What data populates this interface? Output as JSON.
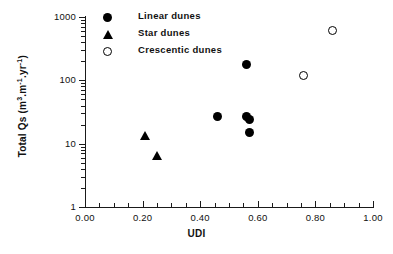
{
  "chart_data": {
    "type": "scatter",
    "title": "",
    "xlabel": "UDI",
    "ylabel": "Total Qs (m3.m-1.yr-1)",
    "ylabel_parts": {
      "prefix": "Total Qs (m",
      "exp1": "3",
      "mid1": ".m",
      "exp2": "-1",
      "mid2": ".yr",
      "exp3": "-1",
      "suffix": ")"
    },
    "xlim": [
      0.0,
      1.0
    ],
    "ylim": [
      1,
      1000
    ],
    "yscale": "log",
    "grid": false,
    "legend_position": "top-left",
    "xticks": [
      "0.00",
      "0.20",
      "0.40",
      "0.60",
      "0.80",
      "1.00"
    ],
    "xtick_values": [
      0.0,
      0.2,
      0.4,
      0.6,
      0.8,
      1.0
    ],
    "yticks": [
      "1000",
      "100",
      "10",
      "1"
    ],
    "ytick_values": [
      1000,
      100,
      10,
      1
    ],
    "series": [
      {
        "name": "Linear dunes",
        "marker": "filled-circle",
        "color": "#000000",
        "points": [
          {
            "x": 0.56,
            "y": 180
          },
          {
            "x": 0.46,
            "y": 27
          },
          {
            "x": 0.56,
            "y": 27
          },
          {
            "x": 0.57,
            "y": 24
          },
          {
            "x": 0.57,
            "y": 15
          }
        ]
      },
      {
        "name": "Star dunes",
        "marker": "filled-triangle",
        "color": "#000000",
        "points": [
          {
            "x": 0.21,
            "y": 13
          },
          {
            "x": 0.25,
            "y": 6.3
          }
        ]
      },
      {
        "name": "Crescentic dunes",
        "marker": "open-circle",
        "color": "#000000",
        "points": [
          {
            "x": 0.86,
            "y": 620
          },
          {
            "x": 0.76,
            "y": 120
          }
        ]
      }
    ]
  },
  "legend": {
    "items": [
      {
        "label": "Linear dunes",
        "marker": "filled-circle"
      },
      {
        "label": "Star dunes",
        "marker": "filled-triangle"
      },
      {
        "label": "Crescentic dunes",
        "marker": "open-circle"
      }
    ]
  }
}
